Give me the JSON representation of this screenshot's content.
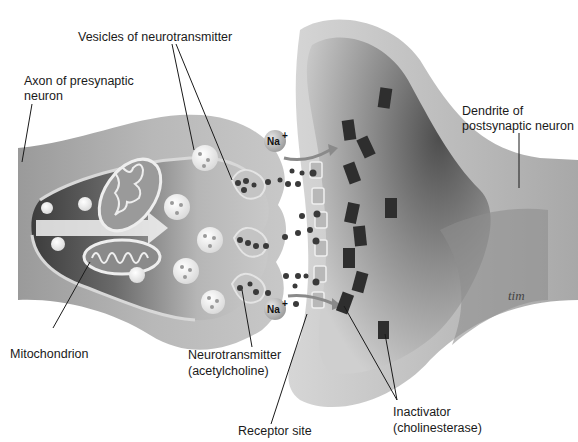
{
  "diagram": {
    "labels": {
      "vesicles": "Vesicles of neurotransmitter",
      "axon_line1": "Axon of presynaptic",
      "axon_line2": "neuron",
      "dendrite_line1": "Dendrite of",
      "dendrite_line2": "postsynaptic neuron",
      "mitochondrion": "Mitochondrion",
      "neurotransmitter_line1": "Neurotransmitter",
      "neurotransmitter_line2": "(acetylcholine)",
      "receptor": "Receptor site",
      "inactivator_line1": "Inactivator",
      "inactivator_line2": "(cholinesterase)"
    },
    "ions": [
      {
        "symbol": "Na",
        "charge": "+"
      },
      {
        "symbol": "Na",
        "charge": "+"
      }
    ],
    "signature": "tim",
    "colors": {
      "background": "#ffffff",
      "membrane_light": "#d2d2d2",
      "cytoplasm_dark": "#4a4a4a",
      "cytoplasm_mid": "#8a8a8a",
      "inactivator": "#2e2e2e",
      "neurotransmitter": "#3a3a3a",
      "label_text": "#1a1a1a"
    }
  }
}
